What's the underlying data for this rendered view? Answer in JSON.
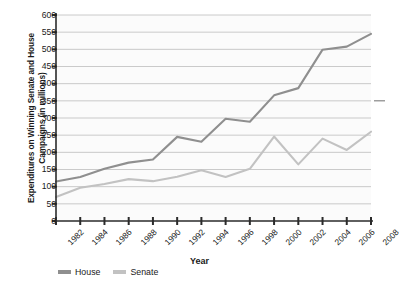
{
  "chart_data": {
    "type": "line",
    "title": "",
    "xlabel": "Year",
    "ylabel": "Expenditures on Winning Senate and House Campaigns (in millions)",
    "x": [
      1982,
      1984,
      1986,
      1988,
      1990,
      1992,
      1994,
      1996,
      1998,
      2000,
      2002,
      2004,
      2006,
      2008
    ],
    "categories": [
      "1982",
      "1984",
      "1986",
      "1988",
      "1990",
      "1992",
      "1994",
      "1996",
      "1998",
      "2000",
      "2002",
      "2004",
      "2006",
      "2008"
    ],
    "series": [
      {
        "name": "House",
        "color": "#8f8f8f",
        "values": [
          115,
          128,
          152,
          170,
          179,
          245,
          231,
          298,
          289,
          366,
          387,
          499,
          508,
          545
        ]
      },
      {
        "name": "Senate",
        "color": "#c2c2c2",
        "values": [
          70,
          97,
          108,
          122,
          116,
          129,
          148,
          128,
          152,
          246,
          165,
          240,
          207,
          260
        ]
      }
    ],
    "ylim": [
      0,
      600
    ],
    "yticks": [
      0,
      50,
      100,
      150,
      200,
      250,
      300,
      350,
      400,
      450,
      500,
      550,
      600
    ],
    "ytick_labels": [
      "0",
      "50",
      "100",
      "150",
      "200",
      "250",
      "300",
      "350",
      "400",
      "450",
      "500",
      "550",
      "600"
    ],
    "grid": true,
    "grid_color": "#b5b5b5",
    "legend_position": "bottom-left",
    "plot_background": "#fbfbfb",
    "axis_color": "#2b2b2b"
  },
  "legend": {
    "items": [
      {
        "label": "House"
      },
      {
        "label": "Senate"
      }
    ]
  },
  "axis_titles": {
    "x": "Year",
    "y": "Expenditures on Winning Senate and House Campaigns (in millions)"
  }
}
